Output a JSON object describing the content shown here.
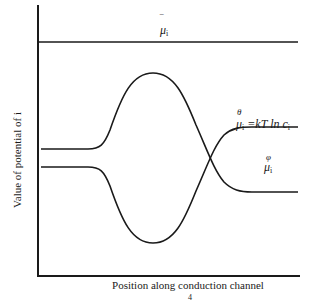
{
  "diagram": {
    "axes": {
      "y_label": "Value of potential of i",
      "x_label": "Position  along conduction channel"
    },
    "curves": [
      {
        "name": "total-potential",
        "label_symbol": "μ",
        "label_bar": "‾",
        "label_sub": "i",
        "shape": "horizontal line"
      },
      {
        "name": "concentration-potential",
        "label_sup": "θ",
        "label_symbol": "μ",
        "label_sub": "i",
        "label_eq": " =kT ln c",
        "label_eq_sub": "i",
        "shape": "rises from left level, peaks mid-channel, falls to lower right level"
      },
      {
        "name": "electrical-potential",
        "label_sup": "φ",
        "label_symbol": "μ",
        "label_sub": "i",
        "shape": "falls from left level, dips mid-channel, rises to upper right level"
      }
    ],
    "footer_mark": "4"
  },
  "colors": {
    "line": "#1a1a1a",
    "background": "#ffffff"
  }
}
